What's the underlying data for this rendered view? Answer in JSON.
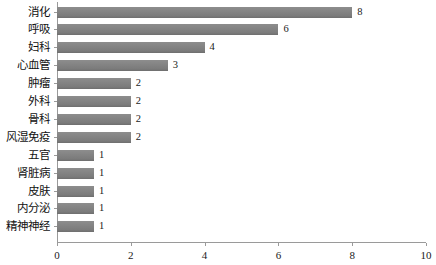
{
  "chart_data": {
    "type": "bar",
    "orientation": "horizontal",
    "title": "",
    "xlabel": "",
    "ylabel": "",
    "xlim": [
      0,
      10
    ],
    "xticks": [
      0,
      2,
      4,
      6,
      8,
      10
    ],
    "grid": false,
    "legend": false,
    "bar_color": "#848484",
    "categories": [
      "消化",
      "呼吸",
      "妇科",
      "心血管",
      "肿瘤",
      "外科",
      "骨科",
      "风湿免疫",
      "五官",
      "肾脏病",
      "皮肤",
      "内分泌",
      "精神神经"
    ],
    "values": [
      8,
      6,
      4,
      3,
      2,
      2,
      2,
      2,
      1,
      1,
      1,
      1,
      1
    ],
    "value_labels": [
      "8",
      "6",
      "4",
      "3",
      "2",
      "2",
      "2",
      "2",
      "1",
      "1",
      "1",
      "1",
      "1"
    ],
    "xtick_labels": [
      "0",
      "2",
      "4",
      "6",
      "8",
      "10"
    ]
  }
}
